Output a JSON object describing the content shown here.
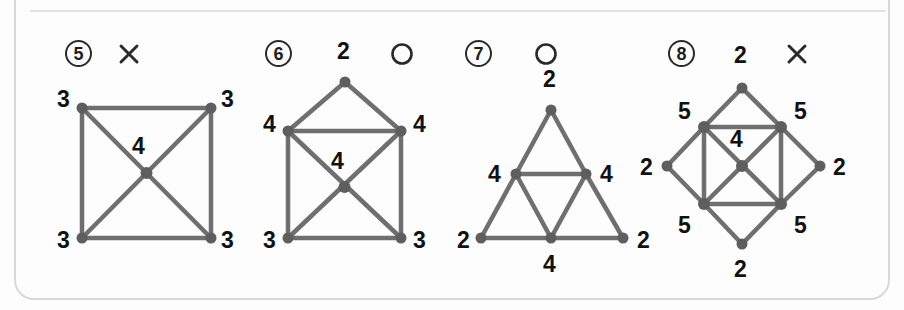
{
  "card": {
    "divider": "divider-line"
  },
  "problems": [
    {
      "id": "problem-5",
      "number": "5",
      "mark": "x",
      "mark_name": "cross-mark",
      "shape": "square-with-center",
      "labels": [
        "3",
        "3",
        "4",
        "3",
        "3"
      ],
      "degrees": {
        "corners": "3",
        "center": "4"
      }
    },
    {
      "id": "problem-6",
      "number": "6",
      "mark": "o",
      "mark_name": "circle-mark",
      "shape": "house-with-center",
      "labels": [
        "2",
        "4",
        "4",
        "4",
        "3",
        "3"
      ],
      "degrees": {
        "apex": "2",
        "upper_corners": "4",
        "center": "4",
        "lower_corners": "3"
      }
    },
    {
      "id": "problem-7",
      "number": "7",
      "mark": "o",
      "mark_name": "circle-mark",
      "shape": "sierpinski-triangle",
      "labels": [
        "2",
        "4",
        "4",
        "2",
        "4",
        "2"
      ],
      "degrees": {
        "corners": "2",
        "midpoints": "4"
      }
    },
    {
      "id": "problem-8",
      "number": "8",
      "mark": "x",
      "mark_name": "cross-mark",
      "shape": "square-in-diamond-with-center",
      "labels": [
        "2",
        "5",
        "5",
        "2",
        "4",
        "2",
        "5",
        "5",
        "2"
      ],
      "degrees": {
        "diamond_points": "2",
        "square_corners": "5",
        "center": "4"
      }
    }
  ],
  "colors": {
    "edge": "#6f6f6f",
    "vertex": "#5e5e5e",
    "text": "#111111",
    "card_border": "#d8d8d8"
  }
}
